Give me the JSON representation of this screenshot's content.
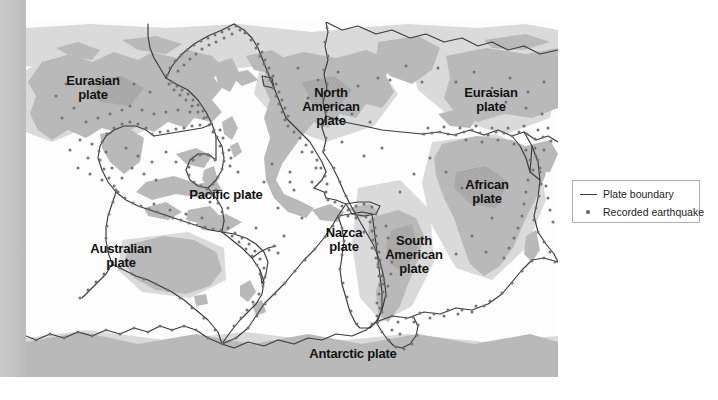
{
  "figure": {
    "kind": "world-tectonic-plate-map",
    "colors": {
      "land": "#b9b9b9",
      "land_dark": "#a8a8a8",
      "shelf": "#d8d8d8",
      "ocean": "#fdfdfd",
      "boundary_line": "#3a3a3a",
      "earthquake_dot": "#6e6e6e",
      "gutter_bar": "#c4c4c4",
      "legend_border": "#b0b0b0",
      "label_text": "#121212"
    }
  },
  "map": {
    "plate_labels": [
      {
        "id": "eurasian-west",
        "text_line1": "Eurasian",
        "text_line2": "plate",
        "x": 58,
        "y": 80,
        "size": 13
      },
      {
        "id": "north-american",
        "text_line1": "North",
        "text_line2": "American",
        "text_line3": "plate",
        "x": 298,
        "y": 92,
        "size": 13
      },
      {
        "id": "eurasian-east",
        "text_line1": "Eurasian",
        "text_line2": "plate",
        "x": 462,
        "y": 92,
        "size": 13
      },
      {
        "id": "african",
        "text_line1": "African",
        "text_line2": "plate",
        "x": 458,
        "y": 186,
        "size": 13
      },
      {
        "id": "pacific",
        "text_line1": "Pacific plate",
        "x": 199,
        "y": 194,
        "size": 13
      },
      {
        "id": "nazca",
        "text_line1": "Nazca",
        "text_line2": "plate",
        "x": 318,
        "y": 232,
        "size": 13
      },
      {
        "id": "south-american",
        "text_line1": "South",
        "text_line2": "American",
        "text_line3": "plate",
        "x": 384,
        "y": 248,
        "size": 13
      },
      {
        "id": "australian",
        "text_line1": "Australian",
        "text_line2": "plate",
        "x": 92,
        "y": 247,
        "size": 13
      },
      {
        "id": "antarctic",
        "text_line1": "Antarctic plate",
        "x": 325,
        "y": 353,
        "size": 13
      }
    ]
  },
  "legend": {
    "title": "",
    "items": [
      {
        "id": "plate-boundary",
        "symbol": "line-icon",
        "label": "Plate boundary"
      },
      {
        "id": "recorded-earthquake",
        "symbol": "dot-icon",
        "label": "Recorded earthquake"
      }
    ]
  }
}
